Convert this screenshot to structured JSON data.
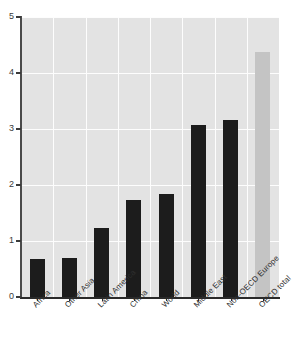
{
  "chart_data": {
    "type": "bar",
    "title": "",
    "xlabel": "",
    "ylabel": "",
    "ylim": [
      0,
      5
    ],
    "ytick_labels": [
      "0",
      "1",
      "2",
      "3",
      "4",
      "5"
    ],
    "ytick_values": [
      0,
      1,
      2,
      3,
      4,
      5
    ],
    "grid": true,
    "legend": "none",
    "categories": [
      "Africa",
      "Other Asia",
      "Latin America",
      "China",
      "World",
      "Middle East",
      "Non-OECD Europe",
      "OECD total"
    ],
    "values": [
      0.68,
      0.69,
      1.23,
      1.73,
      1.84,
      3.07,
      3.16,
      4.38
    ],
    "bar_colors": [
      "#1c1c1c",
      "#1c1c1c",
      "#1c1c1c",
      "#1c1c1c",
      "#1c1c1c",
      "#1c1c1c",
      "#1c1c1c",
      "#c4c4c4"
    ],
    "plot_background": "#e3e3e3",
    "gridline_color": "#fdfdfd",
    "axis_color": "#2a2a2a"
  },
  "footer": {
    "note": ""
  }
}
